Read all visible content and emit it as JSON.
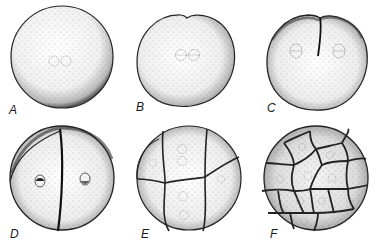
{
  "figure": {
    "panels": [
      {
        "label": "A",
        "stage": "uncleaved egg",
        "nuclei": 2
      },
      {
        "label": "B",
        "stage": "onset of first cleavage furrow",
        "nuclei": 2
      },
      {
        "label": "C",
        "stage": "first cleavage furrow deepening",
        "nuclei": 2
      },
      {
        "label": "D",
        "stage": "two-cell stage",
        "cells": 2
      },
      {
        "label": "E",
        "stage": "eight-cell stage",
        "cells": 8
      },
      {
        "label": "F",
        "stage": "multicellular (morula)",
        "cells": 16
      }
    ]
  },
  "colors": {
    "background": "#ffffff",
    "ink": "#1a1a1a",
    "stipple": "#555555"
  }
}
